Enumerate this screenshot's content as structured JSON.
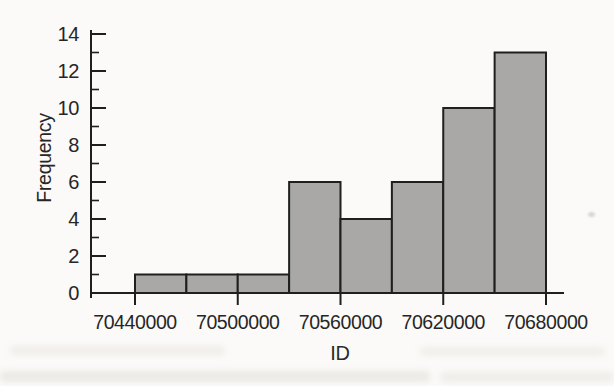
{
  "figure": {
    "background": "#fbfaf8",
    "ink": "#1f1f1f",
    "text_color": "#262626"
  },
  "chart_data": {
    "type": "bar",
    "subtype": "histogram",
    "title": "",
    "xlabel": "ID",
    "ylabel": "Frequency",
    "bin_edges": [
      70440000,
      70470000,
      70500000,
      70530000,
      70560000,
      70590000,
      70620000,
      70650000,
      70680000
    ],
    "frequencies": [
      1,
      1,
      1,
      6,
      4,
      6,
      10,
      13
    ],
    "x_tick_values": [
      70440000,
      70500000,
      70560000,
      70620000,
      70680000
    ],
    "x_tick_labels": [
      "70440000",
      "70500000",
      "70560000",
      "70620000",
      "70680000"
    ],
    "y_ticks": [
      0,
      2,
      4,
      6,
      8,
      10,
      12,
      14
    ],
    "y_minor_ticks": [
      1,
      3,
      5,
      7,
      9,
      11,
      13
    ],
    "xlim": [
      70440000,
      70680000
    ],
    "ylim": [
      0,
      14
    ],
    "grid": false,
    "legend": null,
    "bar_fill": "#a9a8a6",
    "bar_stroke": "#1f1f1f"
  }
}
